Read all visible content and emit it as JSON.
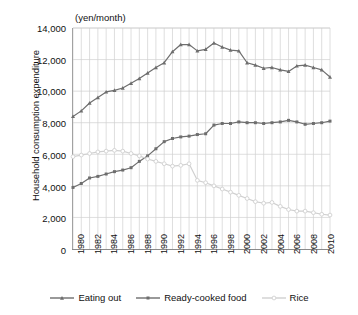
{
  "chart_data": {
    "type": "line",
    "title": "",
    "subtitle": "",
    "unit_caption": "(yen/month)",
    "xlabel": "",
    "ylabel": "Household consumption expenditure",
    "ylim": [
      0,
      14000
    ],
    "xlim": [
      1980,
      2011
    ],
    "grid": true,
    "legend_position": "bottom",
    "y_ticks": [
      "0",
      "2,000",
      "4,000",
      "6,000",
      "8,000",
      "10,000",
      "12,000",
      "14,000"
    ],
    "y_tick_values": [
      0,
      2000,
      4000,
      6000,
      8000,
      10000,
      12000,
      14000
    ],
    "x": [
      1980,
      1981,
      1982,
      1983,
      1984,
      1985,
      1986,
      1987,
      1988,
      1989,
      1990,
      1991,
      1992,
      1993,
      1994,
      1995,
      1996,
      1997,
      1998,
      1999,
      2000,
      2001,
      2002,
      2003,
      2004,
      2005,
      2006,
      2007,
      2008,
      2009,
      2010,
      2011
    ],
    "x_tick_labels": [
      "1980",
      "1982",
      "1984",
      "1986",
      "1988",
      "1990",
      "1992",
      "1994",
      "1996",
      "1998",
      "2000",
      "2002",
      "2004",
      "2006",
      "2008",
      "2010"
    ],
    "x_tick_values": [
      1980,
      1982,
      1984,
      1986,
      1988,
      1990,
      1992,
      1994,
      1996,
      1998,
      2000,
      2002,
      2004,
      2006,
      2008,
      2010
    ],
    "series": [
      {
        "name": "Eating out",
        "color": "#6e6e6e",
        "marker": "triangle",
        "values": [
          8400,
          8750,
          9250,
          9600,
          9950,
          10050,
          10200,
          10500,
          10800,
          11150,
          11500,
          11800,
          12500,
          12950,
          12950,
          12550,
          12650,
          13050,
          12800,
          12600,
          12550,
          11800,
          11650,
          11450,
          11500,
          11350,
          11250,
          11600,
          11650,
          11500,
          11350,
          10900
        ]
      },
      {
        "name": "Ready-cooked food",
        "color": "#6e6e6e",
        "marker": "square",
        "values": [
          3900,
          4150,
          4500,
          4600,
          4750,
          4900,
          5000,
          5150,
          5550,
          5900,
          6350,
          6800,
          7000,
          7100,
          7150,
          7250,
          7300,
          7850,
          7950,
          7950,
          8050,
          8000,
          8000,
          7950,
          8000,
          8050,
          8150,
          8050,
          7900,
          7950,
          8000,
          8100
        ]
      },
      {
        "name": "Rice",
        "color": "#d0d0d0",
        "marker": "circle-open",
        "values": [
          5850,
          5950,
          6050,
          6150,
          6200,
          6250,
          6200,
          6050,
          5900,
          5700,
          5550,
          5400,
          5250,
          5300,
          5400,
          4350,
          4200,
          4000,
          3800,
          3600,
          3400,
          3200,
          3000,
          2900,
          2950,
          2700,
          2500,
          2400,
          2400,
          2300,
          2200,
          2150
        ]
      }
    ],
    "legend": [
      {
        "label": "Eating out",
        "color": "#6e6e6e",
        "marker": "triangle"
      },
      {
        "label": "Ready-cooked food",
        "color": "#6e6e6e",
        "marker": "square"
      },
      {
        "label": "Rice",
        "color": "#d0d0d0",
        "marker": "circle-open"
      }
    ]
  }
}
